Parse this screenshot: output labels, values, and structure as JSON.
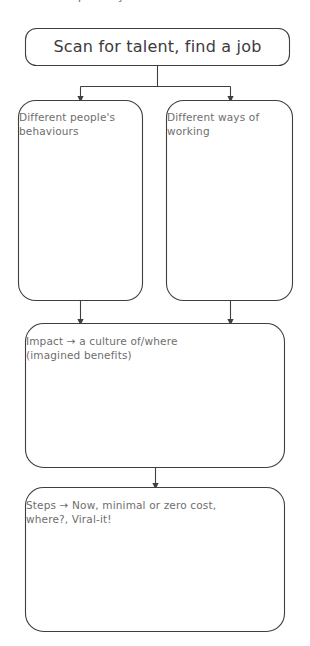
{
  "diagram": {
    "type": "flowchart",
    "background_color": "#ffffff",
    "stroke_color": "#3f3f3f",
    "title_text_color": "#3b3b3b",
    "node_text_color": "#6e6e6e",
    "cropped_top_text": "partially cut-off text",
    "title_node": {
      "label": "Scan for talent, find a job"
    },
    "branch_nodes": [
      {
        "label_line1": "Different people's",
        "label_line2": "behaviours"
      },
      {
        "label_line1": "Different ways of",
        "label_line2": "working"
      }
    ],
    "impact_node": {
      "label_line1": "Impact → a culture of/where",
      "label_line2": "(imagined benefits)"
    },
    "steps_node": {
      "label_line1": "Steps → Now, minimal or zero cost,",
      "label_line2": "where?, Viral-it!"
    }
  }
}
